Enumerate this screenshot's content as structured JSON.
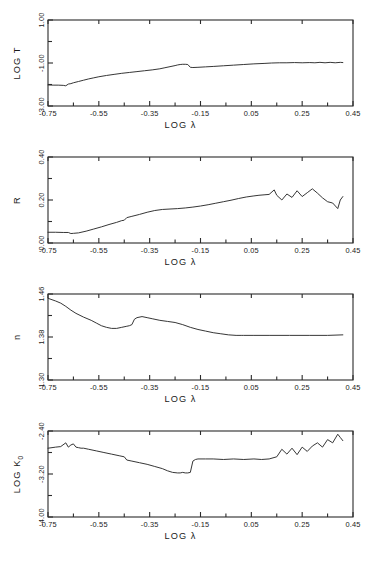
{
  "figure": {
    "title": "",
    "panel_count": 4,
    "background": "#ffffff",
    "line_color": "#2b2b2b"
  },
  "axes": {
    "x_label": "LOG λ",
    "x_ticks": [
      "-0.75",
      "-0.55",
      "-0.35",
      "-0.15",
      "0.05",
      "0.25",
      "0.45"
    ],
    "x_min": -0.75,
    "x_max": 0.45,
    "x_minor_step": 0.1
  },
  "panels": [
    {
      "id": "panel-log-t",
      "y_label": "LOG T",
      "y_ticks": [
        "-3.00",
        "-1.00",
        "1.00"
      ],
      "y_min": -3.0,
      "y_max": 1.0
    },
    {
      "id": "panel-r",
      "y_label": "R",
      "y_ticks": [
        "0.00",
        "0.20",
        "0.40"
      ],
      "y_min": 0.0,
      "y_max": 0.4
    },
    {
      "id": "panel-n",
      "y_label": "n",
      "y_ticks": [
        "1.30",
        "1.38",
        "1.46"
      ],
      "y_min": 1.3,
      "y_max": 1.46
    },
    {
      "id": "panel-log-k0",
      "y_label_main": "LOG K",
      "y_label_sub": "0",
      "y_ticks": [
        "-4.00",
        "-3.20",
        "-2.40"
      ],
      "y_min": -4.0,
      "y_max": -2.4
    }
  ],
  "chart_data": [
    {
      "type": "line",
      "title": "",
      "xlabel": "LOG λ",
      "ylabel": "LOG T",
      "xlim": [
        -0.75,
        0.45
      ],
      "ylim": [
        -3.0,
        1.0
      ],
      "xticks": [
        -0.75,
        -0.55,
        -0.35,
        -0.15,
        0.05,
        0.25,
        0.45
      ],
      "yticks": [
        -3.0,
        -1.0,
        1.0
      ],
      "grid": false,
      "legend": "none",
      "x": [
        -0.75,
        -0.73,
        -0.71,
        -0.69,
        -0.68,
        -0.67,
        -0.66,
        -0.65,
        -0.63,
        -0.61,
        -0.59,
        -0.57,
        -0.55,
        -0.52,
        -0.49,
        -0.46,
        -0.43,
        -0.4,
        -0.37,
        -0.34,
        -0.31,
        -0.29,
        -0.27,
        -0.25,
        -0.24,
        -0.23,
        -0.22,
        -0.21,
        -0.2,
        -0.19,
        -0.18,
        -0.16,
        -0.13,
        -0.1,
        -0.06,
        -0.02,
        0.02,
        0.06,
        0.1,
        0.13,
        0.16,
        0.19,
        0.22,
        0.25,
        0.28,
        0.3,
        0.32,
        0.34,
        0.36,
        0.38,
        0.4,
        0.41
      ],
      "y": [
        -2.02,
        -2.03,
        -2.03,
        -2.04,
        -2.06,
        -1.98,
        -1.96,
        -1.92,
        -1.86,
        -1.8,
        -1.74,
        -1.69,
        -1.64,
        -1.58,
        -1.53,
        -1.48,
        -1.44,
        -1.4,
        -1.36,
        -1.32,
        -1.27,
        -1.22,
        -1.17,
        -1.12,
        -1.09,
        -1.07,
        -1.06,
        -1.06,
        -1.07,
        -1.2,
        -1.21,
        -1.2,
        -1.18,
        -1.16,
        -1.13,
        -1.1,
        -1.07,
        -1.04,
        -1.02,
        -1.0,
        -0.99,
        -0.99,
        -0.98,
        -0.99,
        -0.98,
        -0.99,
        -0.97,
        -0.99,
        -0.97,
        -0.99,
        -0.97,
        -0.98
      ]
    },
    {
      "type": "line",
      "title": "",
      "xlabel": "LOG λ",
      "ylabel": "R",
      "xlim": [
        -0.75,
        0.45
      ],
      "ylim": [
        0.0,
        0.4
      ],
      "xticks": [
        -0.75,
        -0.55,
        -0.35,
        -0.15,
        0.05,
        0.25,
        0.45
      ],
      "yticks": [
        0.0,
        0.2,
        0.4
      ],
      "grid": false,
      "legend": "none",
      "x": [
        -0.75,
        -0.72,
        -0.69,
        -0.67,
        -0.66,
        -0.65,
        -0.63,
        -0.6,
        -0.57,
        -0.54,
        -0.51,
        -0.48,
        -0.46,
        -0.45,
        -0.44,
        -0.42,
        -0.39,
        -0.36,
        -0.33,
        -0.3,
        -0.27,
        -0.24,
        -0.21,
        -0.18,
        -0.15,
        -0.12,
        -0.09,
        -0.06,
        -0.03,
        0.0,
        0.03,
        0.06,
        0.08,
        0.1,
        0.12,
        0.14,
        0.15,
        0.17,
        0.19,
        0.21,
        0.23,
        0.25,
        0.27,
        0.29,
        0.31,
        0.33,
        0.35,
        0.37,
        0.39,
        0.4,
        0.41
      ],
      "y": [
        0.05,
        0.05,
        0.049,
        0.049,
        0.044,
        0.045,
        0.047,
        0.055,
        0.065,
        0.075,
        0.086,
        0.096,
        0.104,
        0.106,
        0.118,
        0.124,
        0.133,
        0.143,
        0.151,
        0.156,
        0.158,
        0.16,
        0.163,
        0.167,
        0.172,
        0.178,
        0.185,
        0.192,
        0.199,
        0.207,
        0.214,
        0.219,
        0.222,
        0.224,
        0.226,
        0.247,
        0.222,
        0.2,
        0.228,
        0.212,
        0.243,
        0.216,
        0.234,
        0.252,
        0.232,
        0.21,
        0.192,
        0.186,
        0.16,
        0.2,
        0.216
      ]
    },
    {
      "type": "line",
      "title": "",
      "xlabel": "LOG λ",
      "ylabel": "n",
      "xlim": [
        -0.75,
        0.45
      ],
      "ylim": [
        1.3,
        1.46
      ],
      "xticks": [
        -0.75,
        -0.55,
        -0.35,
        -0.15,
        0.05,
        0.25,
        0.45
      ],
      "yticks": [
        1.3,
        1.38,
        1.46
      ],
      "grid": false,
      "legend": "none",
      "x": [
        -0.75,
        -0.72,
        -0.7,
        -0.68,
        -0.66,
        -0.64,
        -0.61,
        -0.58,
        -0.56,
        -0.54,
        -0.52,
        -0.5,
        -0.48,
        -0.46,
        -0.44,
        -0.43,
        -0.42,
        -0.41,
        -0.4,
        -0.38,
        -0.36,
        -0.34,
        -0.31,
        -0.28,
        -0.25,
        -0.22,
        -0.19,
        -0.16,
        -0.13,
        -0.1,
        -0.07,
        -0.04,
        -0.01,
        0.01,
        0.02,
        0.06,
        0.12,
        0.2,
        0.28,
        0.35,
        0.41
      ],
      "y": [
        1.452,
        1.447,
        1.443,
        1.437,
        1.43,
        1.424,
        1.417,
        1.411,
        1.406,
        1.401,
        1.398,
        1.396,
        1.396,
        1.398,
        1.4,
        1.401,
        1.403,
        1.413,
        1.416,
        1.418,
        1.416,
        1.414,
        1.411,
        1.409,
        1.407,
        1.403,
        1.398,
        1.394,
        1.391,
        1.388,
        1.386,
        1.384,
        1.383,
        1.383,
        1.383,
        1.383,
        1.383,
        1.383,
        1.383,
        1.383,
        1.384
      ]
    },
    {
      "type": "line",
      "title": "",
      "xlabel": "LOG λ",
      "ylabel": "LOG K0",
      "xlim": [
        -0.75,
        0.45
      ],
      "ylim": [
        -4.0,
        -2.4
      ],
      "xticks": [
        -0.75,
        -0.55,
        -0.35,
        -0.15,
        0.05,
        0.25,
        0.45
      ],
      "yticks": [
        -4.0,
        -3.2,
        -2.4
      ],
      "grid": false,
      "legend": "none",
      "x": [
        -0.75,
        -0.72,
        -0.7,
        -0.68,
        -0.67,
        -0.66,
        -0.65,
        -0.64,
        -0.63,
        -0.62,
        -0.61,
        -0.59,
        -0.56,
        -0.53,
        -0.5,
        -0.47,
        -0.45,
        -0.44,
        -0.42,
        -0.39,
        -0.36,
        -0.33,
        -0.3,
        -0.28,
        -0.26,
        -0.24,
        -0.23,
        -0.22,
        -0.21,
        -0.2,
        -0.19,
        -0.18,
        -0.17,
        -0.16,
        -0.13,
        -0.1,
        -0.06,
        -0.02,
        0.02,
        0.06,
        0.09,
        0.12,
        0.15,
        0.17,
        0.19,
        0.21,
        0.23,
        0.25,
        0.27,
        0.29,
        0.31,
        0.33,
        0.35,
        0.37,
        0.39,
        0.4,
        0.41
      ],
      "y": [
        -2.72,
        -2.7,
        -2.69,
        -2.62,
        -2.7,
        -2.66,
        -2.64,
        -2.7,
        -2.71,
        -2.72,
        -2.72,
        -2.74,
        -2.77,
        -2.8,
        -2.83,
        -2.86,
        -2.88,
        -2.94,
        -2.96,
        -2.99,
        -3.02,
        -3.06,
        -3.1,
        -3.14,
        -3.17,
        -3.18,
        -3.18,
        -3.17,
        -3.18,
        -3.18,
        -3.17,
        -2.96,
        -2.93,
        -2.92,
        -2.92,
        -2.92,
        -2.93,
        -2.92,
        -2.93,
        -2.92,
        -2.93,
        -2.92,
        -2.88,
        -2.74,
        -2.83,
        -2.72,
        -2.84,
        -2.7,
        -2.78,
        -2.68,
        -2.62,
        -2.7,
        -2.56,
        -2.62,
        -2.46,
        -2.52,
        -2.58
      ]
    }
  ]
}
